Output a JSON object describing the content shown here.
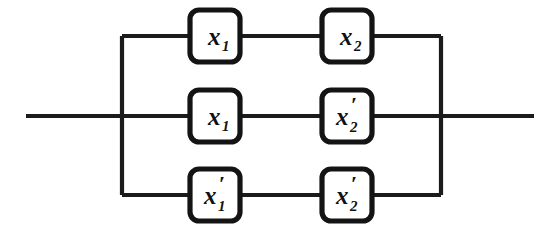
{
  "diagram": {
    "kind": "switching-circuit",
    "background_color": "#ffffff",
    "line_color": "#1b1b1b",
    "box_fill_color": "#ffffff",
    "box_border_color": "#141414",
    "rows": [
      {
        "name": "top-branch",
        "y": 36,
        "contacts": [
          {
            "name": "contact-top-left",
            "variable": "x",
            "subscript": "1",
            "prime": "",
            "label": "x1"
          },
          {
            "name": "contact-top-right",
            "variable": "x",
            "subscript": "2",
            "prime": "",
            "label": "x2"
          }
        ]
      },
      {
        "name": "middle-branch",
        "y": 116,
        "contacts": [
          {
            "name": "contact-middle-left",
            "variable": "x",
            "subscript": "1",
            "prime": "",
            "label": "x1"
          },
          {
            "name": "contact-middle-right",
            "variable": "x",
            "subscript": "2",
            "prime": "′",
            "label": "x2'"
          }
        ]
      },
      {
        "name": "bottom-branch",
        "y": 195,
        "contacts": [
          {
            "name": "contact-bottom-left",
            "variable": "x",
            "subscript": "1",
            "prime": "′",
            "label": "x1'"
          },
          {
            "name": "contact-bottom-right",
            "variable": "x",
            "subscript": "2",
            "prime": "′",
            "label": "x2'"
          }
        ]
      }
    ],
    "terminals": {
      "input_line_label": "",
      "output_line_label": "",
      "input_x_start": 26,
      "output_x_end": 534,
      "left_bus_x": 122,
      "right_bus_x": 441,
      "main_line_y": 116
    },
    "geometry": {
      "column_left_box_x": 190,
      "column_right_box_x": 322,
      "box_width": 50,
      "box_height": 52,
      "box_corner_radius": 9
    }
  }
}
